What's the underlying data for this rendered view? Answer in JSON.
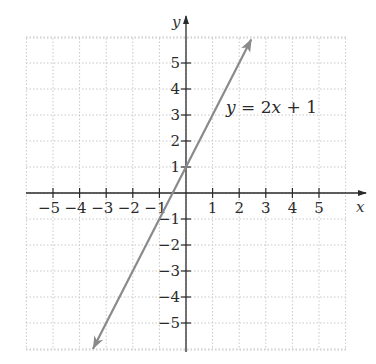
{
  "chart_data": {
    "type": "line",
    "title": "",
    "xlabel": "x",
    "ylabel": "y",
    "xlim": [
      -6,
      6
    ],
    "ylim": [
      -6,
      6
    ],
    "grid": true,
    "grid_style": "dotted",
    "x_ticks": [
      -5,
      -4,
      -3,
      -2,
      -1,
      1,
      2,
      3,
      4,
      5
    ],
    "y_ticks": [
      -5,
      -4,
      -3,
      -2,
      -1,
      1,
      2,
      3,
      4,
      5
    ],
    "x_tick_labels": [
      "−5",
      "−4",
      "−3",
      "−2",
      "−1",
      "1",
      "2",
      "3",
      "4",
      "5"
    ],
    "y_tick_labels": [
      "−5",
      "−4",
      "−3",
      "−2",
      "−1",
      "1",
      "2",
      "3",
      "4",
      "5"
    ],
    "series": [
      {
        "name": "y = 2x + 1",
        "equation": "y = 2x + 1",
        "slope": 2,
        "intercept": 1,
        "x": [
          -3.5,
          2.45
        ],
        "y": [
          -6,
          5.9
        ],
        "color": "#8a8a8a",
        "arrows": "both"
      }
    ],
    "annotations": [
      {
        "text_parts": [
          "y",
          " = 2",
          "x",
          " + 1"
        ],
        "x": 1.6,
        "y": 3.2
      }
    ]
  },
  "colors": {
    "axis": "#2a2a2a",
    "grid": "#c8c8c8",
    "line": "#8a8a8a"
  }
}
